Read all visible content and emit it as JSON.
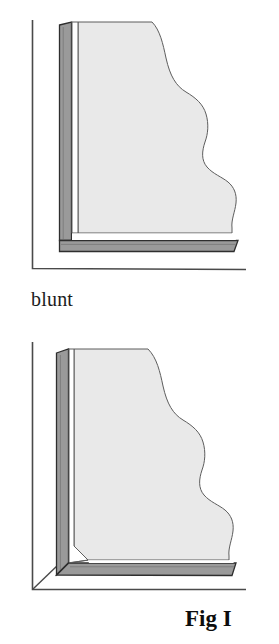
{
  "figure": {
    "label": "Fig I",
    "panels": [
      {
        "id": "blunt",
        "caption": "blunt",
        "joint_type": "blunt",
        "description": "Corner moulding profile with a blunt (butt) joint where the horizontal moulding butts into the end of the vertical moulding."
      },
      {
        "id": "mitered",
        "caption": "mitered",
        "joint_type": "mitered",
        "description": "Corner moulding profile with a mitered joint where both mouldings meet on a 45 degree diagonal."
      }
    ]
  },
  "colors": {
    "background": "#ffffff",
    "outline": "#2b2b2b",
    "moulding_dark": "#9a9a9a",
    "moulding_light": "#e9e9e9",
    "hairline": "#555555",
    "text": "#1c1c1c"
  },
  "geometry": {
    "wall_line_color": "#4a4a4a",
    "blunt": {
      "wall_vertical_x": 32,
      "wall_horizontal_y": 268,
      "dark_strip_left": 59,
      "dark_strip_right": 71,
      "light_shape_left": 78,
      "strip_top": 22,
      "dark_band_top": 240,
      "dark_band_bottom": 251,
      "light_shape_bottom": 233
    },
    "mitered": {
      "wall_vertical_x": 32,
      "wall_horizontal_y": 589,
      "dark_strip_left": 56,
      "dark_strip_right": 68,
      "light_shape_left": 74,
      "strip_top": 349,
      "miter_corner_x": 58,
      "miter_corner_y": 576
    }
  }
}
